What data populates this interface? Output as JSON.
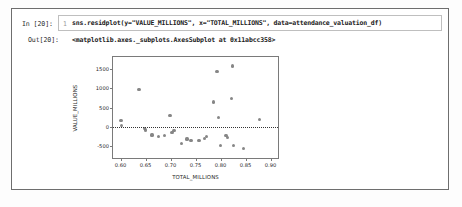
{
  "notebook": {
    "input": {
      "prompt": "In [20]:",
      "line_number": "1",
      "code": "sns.residplot(y=\"VALUE_MILLIONS\", x=\"TOTAL_MILLIONS\", data=attendance_valuation_df)"
    },
    "output": {
      "prompt": "Out[20]:",
      "text": "<matplotlib.axes._subplots.AxesSubplot at 0x11abcc358>"
    }
  },
  "chart_data": {
    "type": "scatter",
    "title": "",
    "xlabel": "TOTAL_MILLIONS",
    "ylabel": "VALUE_MILLIONS",
    "xlim": [
      0.585,
      0.915
    ],
    "ylim": [
      -800,
      1800
    ],
    "xticks": [
      0.6,
      0.65,
      0.7,
      0.75,
      0.8,
      0.85,
      0.9
    ],
    "xticklabels": [
      "0.60",
      "0.65",
      "0.70",
      "0.75",
      "0.80",
      "0.85",
      "0.90"
    ],
    "yticks": [
      1500,
      1000,
      500,
      0,
      -500
    ],
    "yticklabels": [
      "1500",
      "1000",
      "500",
      "0",
      "-500"
    ],
    "grid": false,
    "legend": null,
    "reference_line": {
      "y": 0,
      "style": "dotted",
      "color": "#333333"
    },
    "marker_color": "#7f7f7f",
    "points": [
      {
        "x": 0.601,
        "y": 160
      },
      {
        "x": 0.602,
        "y": 40
      },
      {
        "x": 0.637,
        "y": 970
      },
      {
        "x": 0.648,
        "y": -50
      },
      {
        "x": 0.65,
        "y": -80
      },
      {
        "x": 0.663,
        "y": -210
      },
      {
        "x": 0.676,
        "y": -250
      },
      {
        "x": 0.688,
        "y": -230
      },
      {
        "x": 0.699,
        "y": 300
      },
      {
        "x": 0.703,
        "y": -140
      },
      {
        "x": 0.707,
        "y": -90
      },
      {
        "x": 0.722,
        "y": -420
      },
      {
        "x": 0.733,
        "y": -310
      },
      {
        "x": 0.741,
        "y": -350
      },
      {
        "x": 0.757,
        "y": -345
      },
      {
        "x": 0.768,
        "y": -300
      },
      {
        "x": 0.772,
        "y": -250
      },
      {
        "x": 0.786,
        "y": 640
      },
      {
        "x": 0.793,
        "y": 1420
      },
      {
        "x": 0.796,
        "y": 250
      },
      {
        "x": 0.8,
        "y": -480
      },
      {
        "x": 0.811,
        "y": -230
      },
      {
        "x": 0.814,
        "y": -280
      },
      {
        "x": 0.822,
        "y": 740
      },
      {
        "x": 0.824,
        "y": 1570
      },
      {
        "x": 0.826,
        "y": -480
      },
      {
        "x": 0.846,
        "y": -560
      },
      {
        "x": 0.878,
        "y": 200
      }
    ]
  }
}
